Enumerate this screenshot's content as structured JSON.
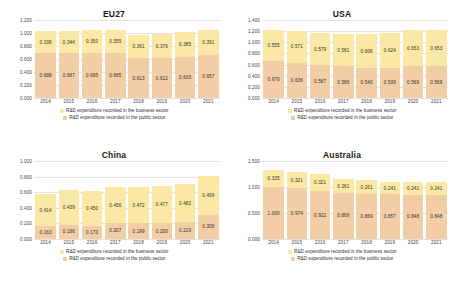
{
  "legend": {
    "business": "R&D expenditure recorded in the business  sector",
    "public": "R&D expenditure recorded in the public sector",
    "colors": {
      "business": "#fbe8a4",
      "public": "#f2cda5"
    }
  },
  "chart_data": [
    {
      "type": "bar",
      "title": "EU27",
      "stacked": true,
      "categories": [
        "2014",
        "2015",
        "2016",
        "2017",
        "2018",
        "2019",
        "2020",
        "2021"
      ],
      "series": [
        {
          "name": "R&D expenditure recorded in the public sector",
          "color": "#f2cda5",
          "values": [
            0.688,
            0.687,
            0.695,
            0.685,
            0.613,
            0.612,
            0.633,
            0.657
          ],
          "labels": [
            "0.688",
            "0.687",
            "0.695",
            "0.685",
            "0.613",
            "0.612",
            "0.633",
            "0.657"
          ]
        },
        {
          "name": "R&D expenditure recorded in the business  sector",
          "color": "#fbe8a4",
          "values": [
            0.338,
            0.344,
            0.35,
            0.355,
            0.361,
            0.376,
            0.385,
            0.391
          ],
          "labels": [
            "0.338",
            "0.344",
            "0.350",
            "0.355",
            "0.361",
            "0.376",
            "0.385",
            "0.391"
          ]
        }
      ],
      "ylim": [
        0,
        1.2
      ],
      "yticks": [
        "0.000",
        "0.200",
        "0.400",
        "0.600",
        "0.800",
        "1.000",
        "1.200"
      ],
      "ytick_values": [
        0,
        0.2,
        0.4,
        0.6,
        0.8,
        1.0,
        1.2
      ],
      "xlabel": "",
      "ylabel": "",
      "grid": true,
      "legend_position": "bottom"
    },
    {
      "type": "bar",
      "title": "USA",
      "stacked": true,
      "categories": [
        "2014",
        "2015",
        "2016",
        "2017",
        "2018",
        "2019",
        "2020",
        "2021"
      ],
      "series": [
        {
          "name": "R&D expenditure recorded in the public sector",
          "color": "#f2cda5",
          "values": [
            0.67,
            0.636,
            0.587,
            0.566,
            0.54,
            0.539,
            0.569,
            0.569
          ],
          "labels": [
            "0.670",
            "0.636",
            "0.587",
            "0.566",
            "0.540",
            "0.539",
            "0.569",
            "0.569"
          ]
        },
        {
          "name": "R&D expenditure recorded in the business  sector",
          "color": "#fbe8a4",
          "values": [
            0.555,
            0.571,
            0.579,
            0.581,
            0.606,
            0.624,
            0.653,
            0.653
          ],
          "labels": [
            "0.555",
            "0.571",
            "0.579",
            "0.581",
            "0.606",
            "0.624",
            "0.653",
            "0.653"
          ]
        }
      ],
      "ylim": [
        0,
        1.4
      ],
      "yticks": [
        "0.000",
        "0.200",
        "0.400",
        "0.600",
        "0.800",
        "1.000",
        "1.200",
        "1.400"
      ],
      "ytick_values": [
        0,
        0.2,
        0.4,
        0.6,
        0.8,
        1.0,
        1.2,
        1.4
      ],
      "xlabel": "",
      "ylabel": "",
      "grid": true,
      "legend_position": "bottom"
    },
    {
      "type": "bar",
      "title": "China",
      "stacked": true,
      "categories": [
        "2014",
        "2015",
        "2016",
        "2017",
        "2018",
        "2019",
        "2020",
        "2021"
      ],
      "series": [
        {
          "name": "R&D expenditure recorded in the public sector",
          "color": "#f2cda5",
          "values": [
            0.163,
            0.186,
            0.17,
            0.207,
            0.199,
            0.2,
            0.219,
            0.308
          ],
          "labels": [
            "0.163",
            "0.186",
            "0.170",
            "0.207",
            "0.199",
            "0.200",
            "0.219",
            "0.308"
          ]
        },
        {
          "name": "R&D expenditure recorded in the business  sector",
          "color": "#fbe8a4",
          "values": [
            0.414,
            0.439,
            0.45,
            0.456,
            0.472,
            0.477,
            0.482,
            0.499
          ],
          "labels": [
            "0.414",
            "0.439",
            "0.450",
            "0.456",
            "0.472",
            "0.477",
            "0.482",
            "0.499"
          ]
        }
      ],
      "ylim": [
        0,
        1.0
      ],
      "yticks": [
        "0.000",
        "0.200",
        "0.400",
        "0.600",
        "0.800",
        "1.000"
      ],
      "ytick_values": [
        0,
        0.2,
        0.4,
        0.6,
        0.8,
        1.0
      ],
      "xlabel": "",
      "ylabel": "",
      "grid": true,
      "legend_position": "bottom"
    },
    {
      "type": "bar",
      "title": "Australia",
      "stacked": true,
      "categories": [
        "2014",
        "2015",
        "2016",
        "2017",
        "2018",
        "2019",
        "2020",
        "2021"
      ],
      "series": [
        {
          "name": "R&D expenditure recorded in the public sector",
          "color": "#f2cda5",
          "values": [
            1.0,
            0.974,
            0.922,
            0.889,
            0.869,
            0.857,
            0.848,
            0.848
          ],
          "labels": [
            "1.000",
            "0.974",
            "0.922",
            "0.889",
            "0.869",
            "0.857",
            "0.848",
            "0.848"
          ]
        },
        {
          "name": "R&D expenditure recorded in the business  sector",
          "color": "#fbe8a4",
          "values": [
            0.335,
            0.321,
            0.321,
            0.261,
            0.261,
            0.241,
            0.241,
            0.241
          ],
          "labels": [
            "0.335",
            "0.321",
            "0.321",
            "0.261",
            "0.261",
            "0.241",
            "0.241",
            "0.241"
          ]
        }
      ],
      "ylim": [
        0,
        1.5
      ],
      "yticks": [
        "0.000",
        "0.500",
        "1.000",
        "1.500"
      ],
      "ytick_values": [
        0,
        0.5,
        1.0,
        1.5
      ],
      "xlabel": "",
      "ylabel": "",
      "grid": true,
      "legend_position": "bottom"
    }
  ]
}
